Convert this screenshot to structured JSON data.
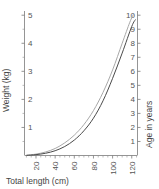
{
  "chart_data": {
    "type": "line",
    "title": "",
    "xlabel": "Total length (cm)",
    "ylabel": "Weight (kg)",
    "y2label": "Age in years",
    "xlim": [
      8,
      126
    ],
    "ylim": [
      0,
      5.15
    ],
    "y2lim": [
      0,
      10.3
    ],
    "grid": false,
    "legend": "none",
    "xticks": [
      20,
      40,
      60,
      80,
      100,
      120
    ],
    "xtick_labels": [
      "20",
      "40",
      "60",
      "80",
      "100",
      "120"
    ],
    "xticks_minor": [
      10,
      15,
      25,
      30,
      35,
      45,
      50,
      55,
      65,
      70,
      75,
      85,
      90,
      95,
      105,
      110,
      115,
      125
    ],
    "yticks": [
      1,
      2,
      3,
      4,
      5
    ],
    "ytick_labels": [
      "1",
      "2",
      "3",
      "4",
      "5"
    ],
    "yticks_minor": [
      0.5,
      1.5,
      2.5,
      3.5,
      4.5
    ],
    "y2ticks": [
      1,
      2,
      3,
      4,
      5,
      6,
      7,
      8,
      9,
      10
    ],
    "y2tick_labels": [
      "1",
      "2",
      "3",
      "4",
      "5",
      "6",
      "7",
      "8",
      "9",
      "10"
    ],
    "series": [
      {
        "name": "Weight vs total length",
        "axis": "left",
        "color": "#4a4a4a",
        "x": [
          10,
          20,
          30,
          40,
          50,
          60,
          70,
          80,
          90,
          100,
          110,
          120,
          124
        ],
        "values": [
          0.005,
          0.03,
          0.08,
          0.17,
          0.32,
          0.55,
          0.88,
          1.33,
          1.95,
          2.75,
          3.65,
          4.6,
          4.85
        ]
      },
      {
        "name": "Age vs total length",
        "axis": "right",
        "color": "#a8a8a8",
        "x": [
          10,
          20,
          30,
          40,
          50,
          60,
          70,
          80,
          90,
          100,
          110,
          118,
          122
        ],
        "values": [
          0.02,
          0.1,
          0.25,
          0.5,
          0.9,
          1.45,
          2.2,
          3.2,
          4.5,
          6.1,
          8.0,
          9.5,
          10.1
        ]
      }
    ]
  },
  "axes": {
    "left": {
      "label": "Weight (kg)"
    },
    "right": {
      "label": "Age in years"
    },
    "bottom": {
      "label": "Total length (cm)"
    }
  }
}
